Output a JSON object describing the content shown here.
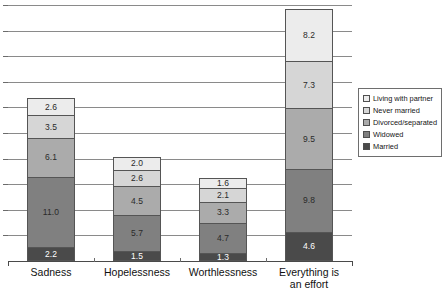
{
  "chart_data": {
    "type": "bar",
    "stacked": true,
    "title": "",
    "subtitle": "",
    "xlabel": "",
    "ylabel": "",
    "ylim": [
      0,
      40
    ],
    "grid": true,
    "gridline_step": 4,
    "gridline_count": 10,
    "axis_tick_labels": [],
    "legend_position": "right",
    "categories": [
      "Sadness",
      "Hopelessness",
      "Worthlessness",
      "Everything is\nan effort"
    ],
    "category_lines": [
      [
        "Sadness"
      ],
      [
        "Hopelessness"
      ],
      [
        "Worthlessness"
      ],
      [
        "Everything is",
        "an effort"
      ]
    ],
    "series": [
      {
        "name": "Married",
        "color": "#4a4a4a",
        "values": [
          2.2,
          1.5,
          1.3,
          4.6
        ],
        "labels": [
          "2.2",
          "1.5",
          "1.3",
          "4.6"
        ]
      },
      {
        "name": "Widowed",
        "color": "#808080",
        "values": [
          11.0,
          5.7,
          4.7,
          9.8
        ],
        "labels": [
          "11.0",
          "5.7",
          "4.7",
          "9.8"
        ]
      },
      {
        "name": "Divorced/separated",
        "color": "#ababab",
        "values": [
          6.1,
          4.5,
          3.3,
          9.5
        ],
        "labels": [
          "6.1",
          "4.5",
          "3.3",
          "9.5"
        ]
      },
      {
        "name": "Never married",
        "color": "#d6d6d6",
        "values": [
          3.5,
          2.6,
          2.1,
          7.3
        ],
        "labels": [
          "3.5",
          "2.6",
          "2.1",
          "7.3"
        ]
      },
      {
        "name": "Living with partner",
        "color": "#ececec",
        "values": [
          2.6,
          2.0,
          1.6,
          8.2
        ],
        "labels": [
          "2.6",
          "2.0",
          "1.6",
          "8.2"
        ]
      }
    ],
    "totals": [
      25.4,
      16.3,
      13.0,
      39.4
    ]
  },
  "legend": {
    "items": [
      {
        "label": "Living with partner",
        "color": "#ececec"
      },
      {
        "label": "Never married",
        "color": "#d6d6d6"
      },
      {
        "label": "Divorced/separated",
        "color": "#ababab"
      },
      {
        "label": "Widowed",
        "color": "#808080"
      },
      {
        "label": "Married",
        "color": "#4a4a4a"
      }
    ]
  },
  "colors": {
    "grid": "#8a8a8a",
    "axis": "#4a4a4a",
    "bar_outline": "#555555",
    "background": "#ffffff",
    "label_light": "#2a2a2a",
    "label_dark": "#ffffff"
  }
}
